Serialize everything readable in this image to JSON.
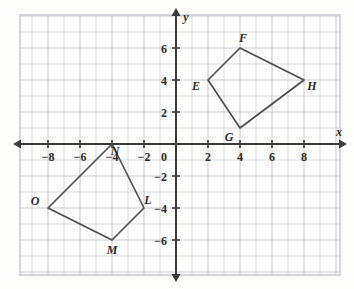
{
  "figure": {
    "background_color": "#fdfdfc",
    "grid_color": "#c9ccd1",
    "axis_color": "#3a3a3a",
    "shape_color": "#4a4a4a",
    "label_color": "#2b2b2b"
  },
  "axes": {
    "x_axis_name": "x",
    "y_axis_name": "y",
    "origin_label": "0",
    "x_ticks": [
      {
        "value": -8,
        "label": "−8"
      },
      {
        "value": -6,
        "label": "−6"
      },
      {
        "value": -4,
        "label": "−4"
      },
      {
        "value": -2,
        "label": "−2"
      },
      {
        "value": 2,
        "label": "2"
      },
      {
        "value": 4,
        "label": "4"
      },
      {
        "value": 6,
        "label": "6"
      },
      {
        "value": 8,
        "label": "8"
      }
    ],
    "y_ticks": [
      {
        "value": 6,
        "label": "6"
      },
      {
        "value": 4,
        "label": "4"
      },
      {
        "value": 2,
        "label": "2"
      },
      {
        "value": -2,
        "label": "−2"
      },
      {
        "value": -4,
        "label": "−4"
      },
      {
        "value": -6,
        "label": "−6"
      }
    ],
    "x_range": [
      -9.75,
      10.25
    ],
    "y_range": [
      -8.0,
      8.0
    ],
    "grid_step": 1
  },
  "chart_data": {
    "type": "scatter",
    "xlabel": "x",
    "ylabel": "y",
    "xlim": [
      -9.75,
      10.25
    ],
    "ylim": [
      -8.0,
      8.0
    ],
    "grid": true,
    "legend": "none",
    "xticks": [
      -8,
      -6,
      -4,
      -2,
      0,
      2,
      4,
      6,
      8
    ],
    "yticks": [
      6,
      4,
      2,
      0,
      -2,
      -4,
      -6
    ],
    "series": [
      {
        "name": "EFGH",
        "closed": true,
        "points": [
          {
            "label": "E",
            "x": 2,
            "y": 4,
            "label_dx": -12,
            "label_dy": 10
          },
          {
            "label": "F",
            "x": 4,
            "y": 6,
            "label_dx": 3,
            "label_dy": -6
          },
          {
            "label": "H",
            "x": 8,
            "y": 4,
            "label_dx": 8,
            "label_dy": 10
          },
          {
            "label": "G",
            "x": 4,
            "y": 1,
            "label_dx": -11,
            "label_dy": 13
          }
        ]
      },
      {
        "name": "LMNO",
        "closed": true,
        "points": [
          {
            "label": "N",
            "x": -4,
            "y": 0,
            "label_dx": 3,
            "label_dy": 11
          },
          {
            "label": "L",
            "x": -2,
            "y": -4,
            "label_dx": 4,
            "label_dy": -4
          },
          {
            "label": "M",
            "x": -4,
            "y": -6,
            "label_dx": 0,
            "label_dy": 14
          },
          {
            "label": "O",
            "x": -8,
            "y": -4,
            "label_dx": -13,
            "label_dy": -3
          }
        ]
      }
    ]
  },
  "shapes": [
    {
      "name": "quadrilateral-efgh",
      "vertex_order": [
        "E",
        "F",
        "H",
        "G"
      ],
      "vertices": {
        "E": [
          2,
          4
        ],
        "F": [
          4,
          6
        ],
        "G": [
          4,
          1
        ],
        "H": [
          8,
          4
        ]
      }
    },
    {
      "name": "quadrilateral-lmno",
      "vertex_order": [
        "N",
        "L",
        "M",
        "O"
      ],
      "vertices": {
        "L": [
          -2,
          -4
        ],
        "M": [
          -4,
          -6
        ],
        "N": [
          -4,
          0
        ],
        "O": [
          -8,
          -4
        ]
      }
    }
  ]
}
